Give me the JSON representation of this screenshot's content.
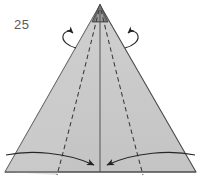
{
  "figure": {
    "step_number": "25",
    "caption": "",
    "type": "origami-fold-diagram"
  },
  "colors": {
    "paper_fill": "#c9c9c9",
    "paper_fill_light": "#d2d2d2",
    "outline": "#4a4a4a",
    "fold_line": "#3a3a3a",
    "arrow": "#2b2b2b",
    "label": "#5a5a5a",
    "background": "#ffffff",
    "apex_shade": "#555555"
  },
  "geometry": {
    "apex": {
      "x": 100,
      "y": 5
    },
    "base_left": {
      "x": 5,
      "y": 172
    },
    "base_right": {
      "x": 196,
      "y": 172
    },
    "center_line_bottom": {
      "x": 100,
      "y": 172
    },
    "dashed_left_bottom": {
      "x": 57,
      "y": 175
    },
    "dashed_right_bottom": {
      "x": 143,
      "y": 175
    },
    "arrow_convergence": {
      "x": 100,
      "y": 166
    }
  },
  "elements": {
    "cone_body_name": "cone-paper-body",
    "apex_name": "cone-apex",
    "center_fold_name": "center-fold-line",
    "left_dashed_name": "left-dashed-fold-line",
    "right_dashed_name": "right-dashed-fold-line",
    "base_line_name": "base-edge-line",
    "left_curve_name": "left-base-curve",
    "right_curve_name": "right-base-curve",
    "left_rotate_arrow_name": "left-rotate-arrow",
    "right_rotate_arrow_name": "right-rotate-arrow",
    "left_fold_arrow_name": "left-fold-arrow",
    "right_fold_arrow_name": "right-fold-arrow"
  }
}
